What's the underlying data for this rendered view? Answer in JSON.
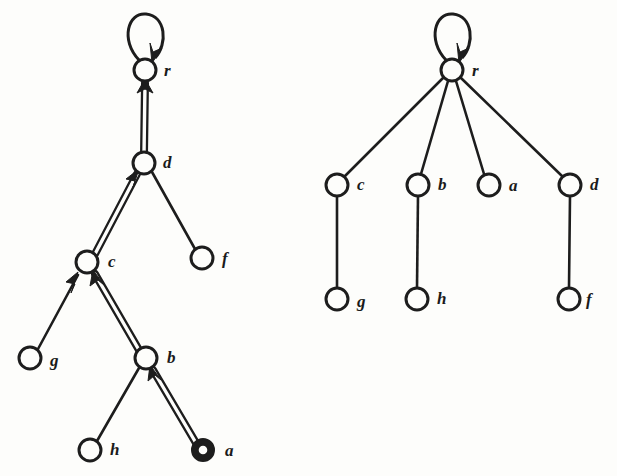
{
  "figure": {
    "caption": "",
    "background_color": "#fdfdfb",
    "ink_color": "#1d1d1d",
    "panels": [
      {
        "id": "left-panel",
        "name": "directed-graph-with-highlighted-path",
        "description": "Directed graph with self-loop at r and a doubled (highlighted) path a to b to c to d to r",
        "nodes": [
          {
            "id": "r",
            "label": "r",
            "x": 145,
            "y": 70,
            "radius": 11,
            "style": "single",
            "label_dx": 19,
            "label_dy": 6
          },
          {
            "id": "d",
            "label": "d",
            "x": 144,
            "y": 163,
            "radius": 11,
            "style": "single",
            "label_dx": 19,
            "label_dy": 5
          },
          {
            "id": "c",
            "label": "c",
            "x": 87,
            "y": 262,
            "radius": 11,
            "style": "single",
            "label_dx": 21,
            "label_dy": 5
          },
          {
            "id": "f",
            "label": "f",
            "x": 202,
            "y": 258,
            "radius": 11,
            "style": "single",
            "label_dx": 20,
            "label_dy": 6
          },
          {
            "id": "g",
            "label": "g",
            "x": 30,
            "y": 358,
            "radius": 11,
            "style": "single",
            "label_dx": 20,
            "label_dy": 8
          },
          {
            "id": "b",
            "label": "b",
            "x": 146,
            "y": 358,
            "radius": 11,
            "style": "single",
            "label_dx": 21,
            "label_dy": 5
          },
          {
            "id": "h",
            "label": "h",
            "x": 90,
            "y": 450,
            "radius": 11,
            "style": "single",
            "label_dx": 20,
            "label_dy": 5
          },
          {
            "id": "a",
            "label": "a",
            "x": 203,
            "y": 450,
            "radius": 10,
            "style": "double",
            "label_dx": 22,
            "label_dy": 6
          }
        ],
        "edges": [
          {
            "from": "r",
            "to": "r",
            "kind": "self-loop",
            "arrow": true,
            "highlighted": true
          },
          {
            "from": "d",
            "to": "r",
            "kind": "straight",
            "arrow": true,
            "highlighted": true
          },
          {
            "from": "c",
            "to": "d",
            "kind": "straight",
            "arrow": true,
            "highlighted": true
          },
          {
            "from": "b",
            "to": "c",
            "kind": "straight",
            "arrow": true,
            "highlighted": true
          },
          {
            "from": "a",
            "to": "b",
            "kind": "straight",
            "arrow": true,
            "highlighted": true
          },
          {
            "from": "g",
            "to": "c",
            "kind": "straight",
            "arrow": true,
            "highlighted": false
          },
          {
            "from": "h",
            "to": "b",
            "kind": "straight",
            "arrow": false,
            "highlighted": false
          },
          {
            "from": "d",
            "to": "f",
            "kind": "straight",
            "arrow": false,
            "highlighted": false
          }
        ]
      },
      {
        "id": "right-panel",
        "name": "rooted-tree-result",
        "description": "Resulting rooted tree with root r, children c, b, a, d and leaves g, h, f",
        "nodes": [
          {
            "id": "r",
            "label": "r",
            "x": 452,
            "y": 70,
            "radius": 11,
            "style": "single",
            "label_dx": 20,
            "label_dy": 6
          },
          {
            "id": "c",
            "label": "c",
            "x": 337,
            "y": 185,
            "radius": 11,
            "style": "single",
            "label_dx": 20,
            "label_dy": 5
          },
          {
            "id": "b",
            "label": "b",
            "x": 418,
            "y": 185,
            "radius": 11,
            "style": "single",
            "label_dx": 20,
            "label_dy": 5
          },
          {
            "id": "a",
            "label": "a",
            "x": 489,
            "y": 185,
            "radius": 11,
            "style": "single",
            "label_dx": 20,
            "label_dy": 6
          },
          {
            "id": "d",
            "label": "d",
            "x": 570,
            "y": 185,
            "radius": 11,
            "style": "single",
            "label_dx": 20,
            "label_dy": 5
          },
          {
            "id": "g",
            "label": "g",
            "x": 337,
            "y": 299,
            "radius": 11,
            "style": "single",
            "label_dx": 20,
            "label_dy": 8
          },
          {
            "id": "h",
            "label": "h",
            "x": 417,
            "y": 299,
            "radius": 11,
            "style": "single",
            "label_dx": 20,
            "label_dy": 5
          },
          {
            "id": "f",
            "label": "f",
            "x": 569,
            "y": 299,
            "radius": 11,
            "style": "single",
            "label_dx": 17,
            "label_dy": 6
          }
        ],
        "edges": [
          {
            "from": "r",
            "to": "r",
            "kind": "self-loop",
            "arrow": true,
            "highlighted": false
          },
          {
            "from": "r",
            "to": "c",
            "kind": "straight",
            "arrow": false,
            "highlighted": false
          },
          {
            "from": "r",
            "to": "b",
            "kind": "straight",
            "arrow": false,
            "highlighted": false
          },
          {
            "from": "r",
            "to": "a",
            "kind": "straight",
            "arrow": false,
            "highlighted": false
          },
          {
            "from": "r",
            "to": "d",
            "kind": "straight",
            "arrow": false,
            "highlighted": false
          },
          {
            "from": "c",
            "to": "g",
            "kind": "straight",
            "arrow": false,
            "highlighted": false
          },
          {
            "from": "b",
            "to": "h",
            "kind": "straight",
            "arrow": false,
            "highlighted": false
          },
          {
            "from": "d",
            "to": "f",
            "kind": "straight",
            "arrow": false,
            "highlighted": false
          }
        ]
      }
    ]
  }
}
